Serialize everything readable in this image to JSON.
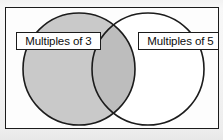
{
  "diagram": {
    "type": "venn",
    "title": "",
    "universe": {
      "name": "universal-set-rectangle",
      "shown": true
    },
    "sets": [
      {
        "id": "left",
        "label": "Multiples of 3",
        "fill": "#c9c9c9",
        "stroke": "#1b1b1b",
        "cx": 73,
        "cy": 61,
        "r": 56
      },
      {
        "id": "right",
        "label": "Multiples of 5",
        "fill": "#ffffff",
        "stroke": "#1b1b1b",
        "cx": 142,
        "cy": 61,
        "r": 56
      }
    ],
    "intersection": {
      "name": "overlap-region",
      "fill": "#bdbdbd",
      "shaded": true,
      "label": ""
    },
    "colors": {
      "page_background": "#f4f4f4",
      "box_background": "#fdfdfd",
      "outline": "#1b1b1b",
      "shaded_region": "#c9c9c9",
      "overlap_region": "#bdbdbd",
      "label_text": "#0d0d0d",
      "label_background": "#ffffff"
    }
  }
}
